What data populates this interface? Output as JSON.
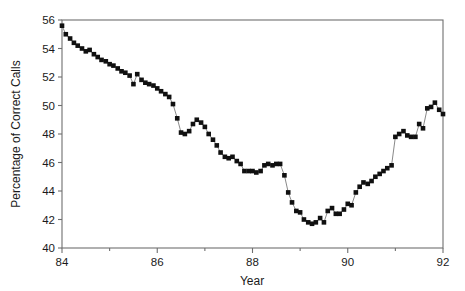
{
  "chart_data": {
    "type": "line",
    "title": "",
    "subtitle": "",
    "xlabel": "Year",
    "ylabel": "Percentage of Correct Calls",
    "xlim": [
      84,
      92
    ],
    "ylim": [
      40,
      56
    ],
    "grid": false,
    "legend": null,
    "marker": "filled-square",
    "marker_color": "#101010",
    "line_color": "#7c7c7c",
    "x_major_ticks": [
      84,
      86,
      88,
      90,
      92
    ],
    "x_major_tick_labels": [
      "84",
      "86",
      "88",
      "90",
      "92"
    ],
    "x_minor_ticks": [
      85,
      87,
      89,
      91
    ],
    "y_ticks": [
      40,
      42,
      44,
      46,
      48,
      50,
      52,
      54,
      56
    ],
    "y_tick_labels": [
      "40",
      "42",
      "44",
      "46",
      "48",
      "50",
      "52",
      "54",
      "56"
    ],
    "annotations": [],
    "series": [
      {
        "name": "Percentage of Correct Calls",
        "x": [
          84.0,
          84.08,
          84.17,
          84.25,
          84.33,
          84.42,
          84.5,
          84.58,
          84.67,
          84.75,
          84.83,
          84.92,
          85.0,
          85.08,
          85.17,
          85.25,
          85.33,
          85.42,
          85.5,
          85.58,
          85.67,
          85.75,
          85.83,
          85.92,
          86.0,
          86.08,
          86.17,
          86.25,
          86.33,
          86.42,
          86.5,
          86.58,
          86.67,
          86.75,
          86.83,
          86.92,
          87.0,
          87.08,
          87.17,
          87.25,
          87.33,
          87.42,
          87.5,
          87.58,
          87.67,
          87.75,
          87.83,
          87.92,
          88.0,
          88.08,
          88.17,
          88.25,
          88.33,
          88.42,
          88.5,
          88.58,
          88.67,
          88.75,
          88.83,
          88.92,
          89.0,
          89.08,
          89.17,
          89.25,
          89.33,
          89.42,
          89.5,
          89.58,
          89.67,
          89.75,
          89.83,
          89.92,
          90.0,
          90.08,
          90.17,
          90.25,
          90.33,
          90.42,
          90.5,
          90.58,
          90.67,
          90.75,
          90.83,
          90.92,
          91.0,
          91.08,
          91.17,
          91.25,
          91.33,
          91.42,
          91.5,
          91.58,
          91.67,
          91.75,
          91.83,
          91.92
        ],
        "values": [
          55.6,
          55.0,
          54.7,
          54.4,
          54.2,
          54.0,
          53.8,
          53.9,
          53.6,
          53.4,
          53.2,
          53.1,
          52.9,
          52.8,
          52.6,
          52.4,
          52.3,
          52.1,
          51.5,
          52.2,
          51.8,
          51.6,
          51.5,
          51.4,
          51.2,
          51.0,
          50.8,
          50.6,
          50.1,
          49.1,
          48.1,
          48.0,
          48.2,
          48.7,
          49.0,
          48.8,
          48.5,
          48.0,
          47.6,
          47.2,
          46.7,
          46.4,
          46.3,
          46.4,
          46.1,
          45.9,
          45.4,
          45.4,
          45.4,
          45.3,
          45.4,
          45.8,
          45.9,
          45.8,
          45.9,
          45.9,
          45.1,
          43.9,
          43.2,
          42.6,
          42.5,
          42.0,
          41.8,
          41.7,
          41.8,
          42.1,
          41.8,
          42.6,
          42.8,
          42.4,
          42.4,
          42.7,
          43.1,
          43.0,
          43.9,
          44.3,
          44.6,
          44.5,
          44.7,
          45.0,
          45.2,
          45.4,
          45.6,
          45.8,
          45.7,
          46.1,
          46.3,
          46.6,
          47.1,
          47.4,
          46.9,
          47.0,
          46.4,
          47.1,
          47.4,
          47.8
        ]
      },
      {
        "name": "Percentage of Correct Calls (continued)",
        "x": [
          91.95,
          92.0
        ],
        "values": [
          49.5,
          49.4
        ]
      }
    ],
    "series_tail": {
      "x": [
        91.0,
        91.08,
        91.17,
        91.25,
        91.33,
        91.42,
        91.5,
        91.58,
        91.67,
        91.75,
        91.83,
        91.92,
        92.0
      ],
      "values": [
        47.8,
        48.0,
        48.2,
        47.9,
        47.8,
        47.8,
        48.7,
        48.4,
        49.8,
        49.9,
        50.2,
        49.7,
        49.4
      ]
    }
  },
  "figure": {
    "axis_color": "#6f6f6f",
    "marker_color": "#101010",
    "line_color": "#7c7c7c",
    "background": "#ffffff"
  }
}
